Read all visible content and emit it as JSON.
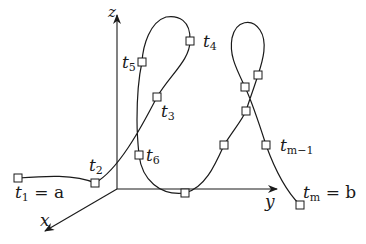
{
  "diagram": {
    "axes": {
      "x": {
        "label": "x"
      },
      "y": {
        "label": "y"
      },
      "z": {
        "label": "z"
      }
    },
    "points": [
      {
        "id": "t1",
        "name": "t",
        "sub": "1",
        "suffix": "= a"
      },
      {
        "id": "t2",
        "name": "t",
        "sub": "2",
        "suffix": ""
      },
      {
        "id": "t3",
        "name": "t",
        "sub": "3",
        "suffix": ""
      },
      {
        "id": "t4",
        "name": "t",
        "sub": "4",
        "suffix": ""
      },
      {
        "id": "t5",
        "name": "t",
        "sub": "5",
        "suffix": ""
      },
      {
        "id": "t6",
        "name": "t",
        "sub": "6",
        "suffix": ""
      },
      {
        "id": "tm1",
        "name": "t",
        "sub": "m−1",
        "suffix": ""
      },
      {
        "id": "tm",
        "name": "t",
        "sub": "m",
        "suffix": "= b"
      }
    ],
    "colors": {
      "stroke": "#1a1a1a",
      "background": "#ffffff"
    }
  }
}
